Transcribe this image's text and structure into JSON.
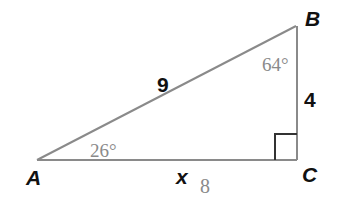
{
  "diagram": {
    "type": "right-triangle",
    "vertices": {
      "A": {
        "label": "A",
        "x": 37,
        "y": 160
      },
      "B": {
        "label": "B",
        "x": 296,
        "y": 26
      },
      "C": {
        "label": "C",
        "x": 297,
        "y": 160
      }
    },
    "sides": {
      "AB": {
        "label": "9"
      },
      "BC": {
        "label": "4"
      },
      "AC": {
        "label": "x",
        "answer": "8"
      }
    },
    "angles": {
      "A": {
        "label": "26°"
      },
      "B": {
        "label": "64°"
      },
      "C": {
        "right_angle": true
      }
    },
    "colors": {
      "line": "#8a8a8a",
      "right_angle_marker": "#333333",
      "label_text": "#111111",
      "handwritten_text": "#8a8a8a"
    }
  }
}
